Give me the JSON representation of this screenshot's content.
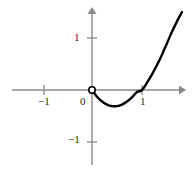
{
  "figure": {
    "kind": "cartesian-graph",
    "width": 196,
    "height": 173,
    "background_color": "#ffffff",
    "axis_color": "#8a8a8a",
    "curve_color": "#000000",
    "text_color": "#231f20"
  },
  "labels": {
    "x_neg1": "−1",
    "origin": "0",
    "x_1": "1",
    "y_1": "1",
    "y_neg1": "−1"
  },
  "chart_data": {
    "type": "line",
    "title": "",
    "xlabel": "",
    "ylabel": "",
    "xlim": [
      -1.6,
      1.8
    ],
    "ylim": [
      -1.55,
      1.6
    ],
    "grid": false,
    "legend": null,
    "x_ticks": [
      -1,
      0,
      1
    ],
    "x_tick_labels": [
      "−1",
      "0",
      "1"
    ],
    "y_ticks": [
      -1,
      1
    ],
    "y_tick_labels": [
      "−1",
      "1"
    ],
    "axes": {
      "x_axis_arrow": "right",
      "y_axis_arrow": "up",
      "x_axis_range_px": [
        12,
        182
      ],
      "y_axis_range_px": [
        10,
        165
      ],
      "origin_px": [
        92,
        90
      ],
      "unit_px_x": 50,
      "unit_px_y": 52
    },
    "series": [
      {
        "name": "curve",
        "style": "solid",
        "width_px": 2.4,
        "domain": [
          0,
          1.8
        ],
        "x": [
          0.0,
          0.1,
          0.2,
          0.3,
          0.4,
          0.5,
          0.6,
          0.7,
          0.8,
          0.9,
          1.0,
          1.1,
          1.2,
          1.3,
          1.4,
          1.5,
          1.6,
          1.7,
          1.8
        ],
        "y": [
          0.0,
          -0.13,
          -0.22,
          -0.28,
          -0.31,
          -0.31,
          -0.28,
          -0.22,
          -0.14,
          -0.04,
          0.0,
          0.14,
          0.3,
          0.48,
          0.68,
          0.9,
          1.12,
          1.32,
          1.5
        ]
      }
    ],
    "markers": [
      {
        "name": "open-circle-at-origin",
        "x": 0,
        "y": 0,
        "filled": false,
        "radius_px": 3.2,
        "edge_color": "#000000",
        "face_color": "#ffffff"
      }
    ]
  }
}
